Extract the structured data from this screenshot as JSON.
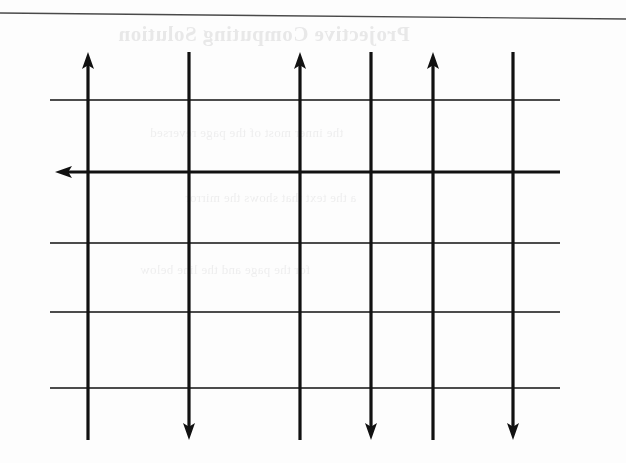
{
  "page": {
    "width": 626,
    "height": 463,
    "background_color": "#fdfdfd",
    "ink_color": "#111111",
    "rule_color": "#4a4a4a",
    "ghost_color": "#b9b9bb"
  },
  "top_rule": {
    "label": "page-edge-rule",
    "x1": 0,
    "y1": 13,
    "x2": 626,
    "y2": 19,
    "thickness": 1.4
  },
  "ghost_text": {
    "note": "faint mirrored show-through from reverse side of the scanned page",
    "title": "Projective Computing Solution",
    "lines": [
      "the inner most of the page reversed",
      "a the text that shows the mirror",
      "for the page and the line below"
    ]
  },
  "figure": {
    "name": "arrow-grid-diagram",
    "caption": "",
    "vertical_lines": [
      {
        "id": "v1",
        "x": 88,
        "y_top": 52,
        "y_bottom": 440,
        "thickness": 3.2,
        "arrow_top": true,
        "arrow_bottom": false
      },
      {
        "id": "v2",
        "x": 189,
        "y_top": 52,
        "y_bottom": 440,
        "thickness": 3.2,
        "arrow_top": false,
        "arrow_bottom": true
      },
      {
        "id": "v3",
        "x": 300,
        "y_top": 52,
        "y_bottom": 440,
        "thickness": 3.2,
        "arrow_top": true,
        "arrow_bottom": false
      },
      {
        "id": "v4",
        "x": 371,
        "y_top": 52,
        "y_bottom": 440,
        "thickness": 3.2,
        "arrow_top": false,
        "arrow_bottom": true
      },
      {
        "id": "v5",
        "x": 433,
        "y_top": 52,
        "y_bottom": 440,
        "thickness": 3.2,
        "arrow_top": true,
        "arrow_bottom": false
      },
      {
        "id": "v6",
        "x": 513,
        "y_top": 52,
        "y_bottom": 440,
        "thickness": 3.2,
        "arrow_top": false,
        "arrow_bottom": true
      }
    ],
    "horizontal_lines": [
      {
        "id": "h1",
        "y": 100,
        "x_left": 50,
        "x_right": 560,
        "thickness": 1.5,
        "arrow_left": false
      },
      {
        "id": "h2",
        "y": 172,
        "x_left": 55,
        "x_right": 560,
        "thickness": 3.2,
        "arrow_left": true
      },
      {
        "id": "h3",
        "y": 243,
        "x_left": 50,
        "x_right": 560,
        "thickness": 1.5,
        "arrow_left": false
      },
      {
        "id": "h4",
        "y": 312,
        "x_left": 50,
        "x_right": 560,
        "thickness": 1.5,
        "arrow_left": false
      },
      {
        "id": "h5",
        "y": 388,
        "x_left": 50,
        "x_right": 560,
        "thickness": 1.5,
        "arrow_left": false
      }
    ],
    "arrow_head": {
      "length": 17,
      "half_width": 6
    },
    "counts": {
      "vertical_lines": 6,
      "horizontal_lines": 5,
      "up_arrows": 3,
      "down_arrows": 3,
      "left_arrows": 1
    }
  }
}
